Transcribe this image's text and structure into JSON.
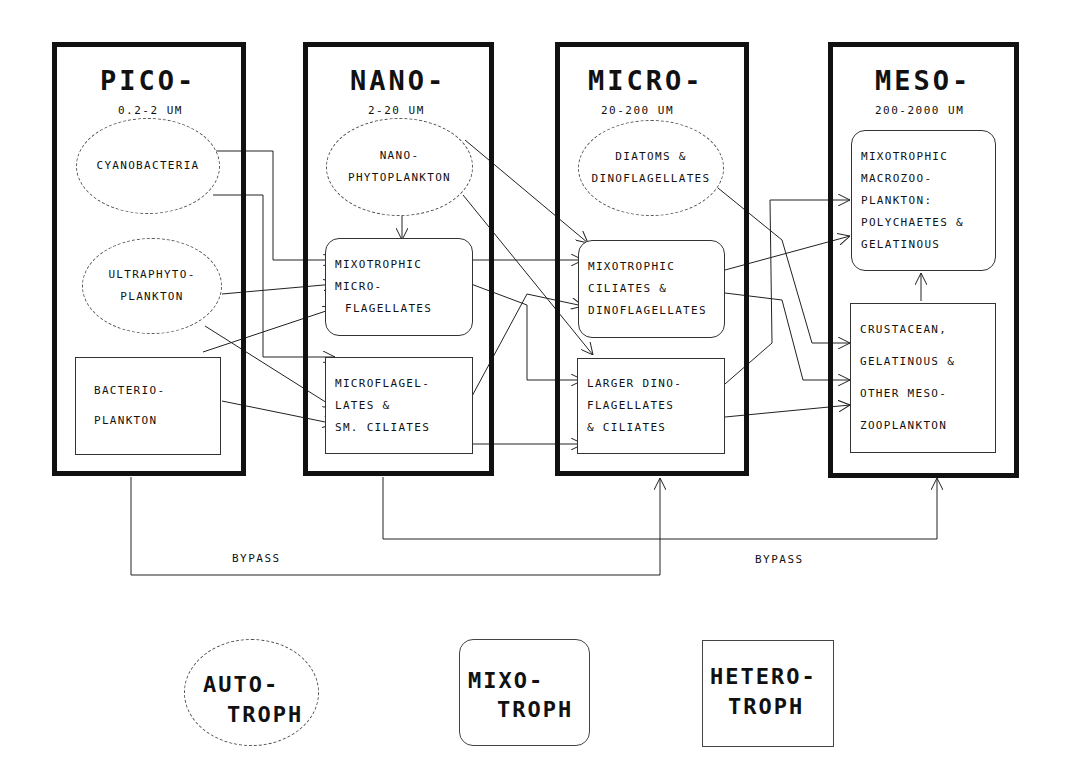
{
  "columns": [
    {
      "id": "pico",
      "title": "PICO-",
      "range": "0.2-2 UM"
    },
    {
      "id": "nano",
      "title": "NANO-",
      "range": "2-20 UM"
    },
    {
      "id": "micro",
      "title": "MICRO-",
      "range": "20-200 UM"
    },
    {
      "id": "meso",
      "title": "MESO-",
      "range": "200-2000 UM"
    }
  ],
  "nodes": {
    "cyanobacteria": {
      "type": "autotroph",
      "lines": [
        "CYANOBACTERIA"
      ]
    },
    "ultraphytoplankton": {
      "type": "autotroph",
      "lines": [
        "ULTRAPHYTO-",
        "PLANKTON"
      ]
    },
    "bacterioplankton": {
      "type": "heterotroph",
      "lines": [
        "BACTERIO-",
        "PLANKTON"
      ]
    },
    "nanophytoplankton": {
      "type": "autotroph",
      "lines": [
        "NANO-",
        "PHYTOPLANKTON"
      ]
    },
    "mixotrophic_microflagellates": {
      "type": "mixotroph",
      "lines": [
        "MIXOTROPHIC",
        "MICRO-",
        "FLAGELLATES"
      ]
    },
    "microflagellates_sm_ciliates": {
      "type": "heterotroph",
      "lines": [
        "MICROFLAGEL-",
        "LATES &",
        "SM. CILIATES"
      ]
    },
    "diatoms_dinoflagellates": {
      "type": "autotroph",
      "lines": [
        "DIATOMS &",
        "DINOFLAGELLATES"
      ]
    },
    "mixotrophic_ciliates_dinoflagellates": {
      "type": "mixotroph",
      "lines": [
        "MIXOTROPHIC",
        "CILIATES &",
        "DINOFLAGELLATES"
      ]
    },
    "larger_dinoflagellates_ciliates": {
      "type": "heterotroph",
      "lines": [
        "LARGER DINO-",
        "FLAGELLATES",
        "& CILIATES"
      ]
    },
    "mixotrophic_macrozooplankton": {
      "type": "mixotroph",
      "lines": [
        "MIXOTROPHIC",
        "MACROZOO-",
        "PLANKTON:",
        "POLYCHAETES &",
        "GELATINOUS"
      ]
    },
    "crustacean_mesozooplankton": {
      "type": "heterotroph",
      "lines": [
        "CRUSTACEAN,",
        "GELATINOUS &",
        "OTHER MESO-",
        "ZOOPLANKTON"
      ]
    }
  },
  "edges": [
    {
      "from": "cyanobacteria",
      "to": "mixotrophic_microflagellates"
    },
    {
      "from": "cyanobacteria",
      "to": "microflagellates_sm_ciliates"
    },
    {
      "from": "ultraphytoplankton",
      "to": "mixotrophic_microflagellates"
    },
    {
      "from": "ultraphytoplankton",
      "to": "microflagellates_sm_ciliates"
    },
    {
      "from": "bacterioplankton",
      "to": "mixotrophic_microflagellates"
    },
    {
      "from": "bacterioplankton",
      "to": "microflagellates_sm_ciliates"
    },
    {
      "from": "nanophytoplankton",
      "to": "mixotrophic_microflagellates"
    },
    {
      "from": "nanophytoplankton",
      "to": "mixotrophic_ciliates_dinoflagellates"
    },
    {
      "from": "nanophytoplankton",
      "to": "larger_dinoflagellates_ciliates"
    },
    {
      "from": "mixotrophic_microflagellates",
      "to": "mixotrophic_ciliates_dinoflagellates"
    },
    {
      "from": "mixotrophic_microflagellates",
      "to": "larger_dinoflagellates_ciliates"
    },
    {
      "from": "microflagellates_sm_ciliates",
      "to": "mixotrophic_ciliates_dinoflagellates"
    },
    {
      "from": "microflagellates_sm_ciliates",
      "to": "larger_dinoflagellates_ciliates"
    },
    {
      "from": "diatoms_dinoflagellates",
      "to": "crustacean_mesozooplankton"
    },
    {
      "from": "mixotrophic_ciliates_dinoflagellates",
      "to": "mixotrophic_macrozooplankton"
    },
    {
      "from": "mixotrophic_ciliates_dinoflagellates",
      "to": "crustacean_mesozooplankton"
    },
    {
      "from": "larger_dinoflagellates_ciliates",
      "to": "mixotrophic_macrozooplankton"
    },
    {
      "from": "larger_dinoflagellates_ciliates",
      "to": "crustacean_mesozooplankton"
    },
    {
      "from": "crustacean_mesozooplankton",
      "to": "mixotrophic_macrozooplankton"
    },
    {
      "from": "pico",
      "to": "micro",
      "label": "BYPASS"
    },
    {
      "from": "nano",
      "to": "meso",
      "label": "BYPASS"
    }
  ],
  "bypass_labels": [
    "BYPASS",
    "BYPASS"
  ],
  "legend": [
    {
      "shape": "ellipse",
      "line1": "AUTO-",
      "line2": "TROPH"
    },
    {
      "shape": "rounded-rect",
      "line1": "MIXO-",
      "line2": "TROPH"
    },
    {
      "shape": "rect",
      "line1": "HETERO-",
      "line2": "TROPH"
    }
  ]
}
